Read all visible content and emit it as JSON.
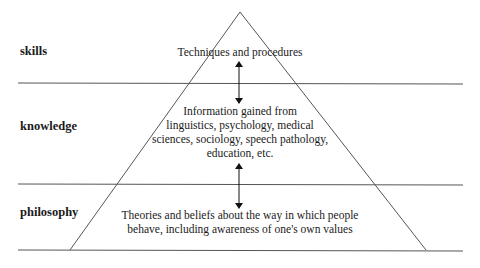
{
  "diagram": {
    "type": "pyramid",
    "levels": [
      {
        "label": "skills",
        "description": [
          "Techniques and procedures"
        ]
      },
      {
        "label": "knowledge",
        "description": [
          "Information gained from",
          "linguistics, psychology, medical",
          "sciences, sociology, speech pathology,",
          "education, etc."
        ]
      },
      {
        "label": "philosophy",
        "description": [
          "Theories and beliefs about the way in which people",
          "behave, including awareness of one's own values"
        ]
      }
    ],
    "arrows": [
      {
        "between": [
          "skills",
          "knowledge"
        ],
        "direction": "bidirectional"
      },
      {
        "between": [
          "knowledge",
          "philosophy"
        ],
        "direction": "bidirectional"
      }
    ],
    "colors": {
      "line": "#555555",
      "text": "#1a1a1a",
      "background": "#ffffff"
    }
  }
}
